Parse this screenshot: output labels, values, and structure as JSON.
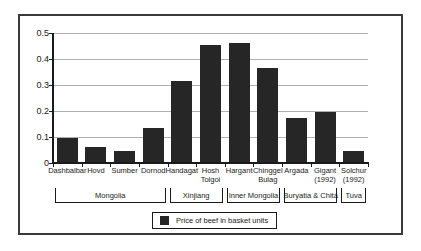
{
  "chart_data": {
    "type": "bar",
    "title": "",
    "categories": [
      "Dashbalbar",
      "Hovd",
      "Sumber",
      "Dornod",
      "Handagat",
      "Hosh Tolgoi",
      "Hargant",
      "Chinggel Bulag",
      "Argada",
      "Gigant (1992)",
      "Solchur (1992)"
    ],
    "values": [
      0.095,
      0.063,
      0.045,
      0.133,
      0.314,
      0.454,
      0.462,
      0.366,
      0.174,
      0.198,
      0.048
    ],
    "region_groups": [
      {
        "label": "Mongolia",
        "span": [
          0,
          3
        ]
      },
      {
        "label": "Xinjiang",
        "span": [
          4,
          5
        ]
      },
      {
        "label": "Inner Mongolia",
        "span": [
          6,
          7
        ]
      },
      {
        "label": "Buryatia & Chita",
        "span": [
          8,
          9
        ]
      },
      {
        "label": "Tuva",
        "span": [
          10,
          10
        ]
      }
    ],
    "legend": "Price of beef in basket units",
    "xlabel": "",
    "ylabel": "",
    "ylim": [
      0,
      0.5
    ],
    "yticks": [
      0,
      0.1,
      0.2,
      0.3,
      0.4,
      0.5
    ],
    "grid": true,
    "legend_position": "bottom-center",
    "colors": {
      "bar": "#262626",
      "grid": "#b0b0b0",
      "axis": "#1a1a1a",
      "frame": "#3a3a3a",
      "text": "#1a1a1a"
    }
  }
}
